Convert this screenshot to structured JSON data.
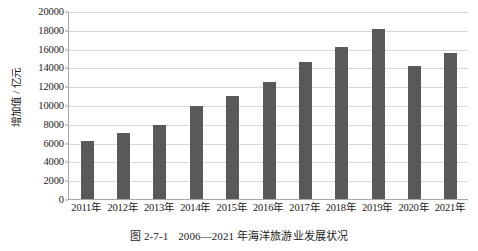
{
  "caption": {
    "figure_number": "图 2-7-1",
    "title": "2006—2021 年海洋旅游业发展状况"
  },
  "chart_data": {
    "type": "bar",
    "title": "",
    "xlabel": "",
    "ylabel": "增加值 / 亿元",
    "ylim": [
      0,
      20000
    ],
    "ytick_step": 2000,
    "grid": true,
    "legend": "none",
    "bar_color": "#595959",
    "axis_color": "#a6a6a6",
    "gridline_color": "#d8d8d8",
    "categories": [
      "2011年",
      "2012年",
      "2013年",
      "2014年",
      "2015年",
      "2016年",
      "2017年",
      "2018年",
      "2019年",
      "2020年",
      "2021年"
    ],
    "values": [
      6200,
      7000,
      7900,
      9900,
      11000,
      12500,
      14600,
      16200,
      18100,
      14100,
      15500
    ],
    "yticks": [
      0,
      2000,
      4000,
      6000,
      8000,
      10000,
      12000,
      14000,
      16000,
      18000,
      20000
    ],
    "ytick_labels": [
      "0",
      "2000",
      "4000",
      "6000",
      "8000",
      "10000",
      "12000",
      "14000",
      "16000",
      "18000",
      "20000"
    ]
  }
}
